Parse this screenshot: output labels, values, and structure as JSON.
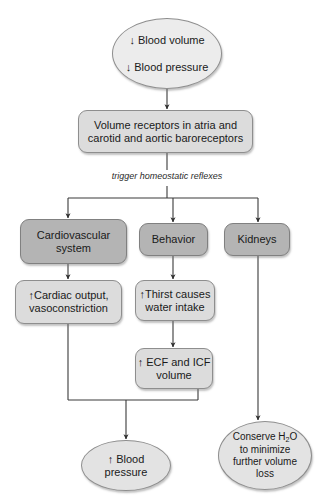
{
  "diagram": {
    "colors": {
      "oval_fill": "#e3e3e3",
      "top_oval_fill": "#ececec",
      "box_fill": "#dcdcdc",
      "dark_box_fill": "#b4b4b4",
      "stroke": "#8e8e8e",
      "line": "#3a3a3a",
      "text": "#1a1a1a"
    },
    "nodes": {
      "stimulus": {
        "shape": "oval",
        "line1": "↓ Blood volume",
        "line2": "↓ Blood pressure"
      },
      "receptors": {
        "shape": "rounded-rect",
        "text": "Volume receptors in atria and\ncarotid and aortic baroreceptors"
      },
      "reflex_label": {
        "shape": "text",
        "text": "trigger homeostatic reflexes"
      },
      "cardiovascular": {
        "shape": "rounded-rect",
        "text": "Cardiovascular\nsystem"
      },
      "behavior": {
        "shape": "rounded-rect",
        "text": "Behavior"
      },
      "kidneys": {
        "shape": "rounded-rect",
        "text": "Kidneys"
      },
      "cardiac_output": {
        "shape": "rounded-rect",
        "text": "↑Cardiac output,\nvasoconstriction"
      },
      "thirst": {
        "shape": "rounded-rect",
        "text": "↑Thirst causes\nwater intake"
      },
      "ecf_icf": {
        "shape": "rounded-rect",
        "text": "↑ ECF and ICF\nvolume"
      },
      "blood_pressure_result": {
        "shape": "oval",
        "text": "↑ Blood\npressure"
      },
      "conserve_water": {
        "shape": "oval",
        "line1_prefix": "Conserve H",
        "line1_sub": "2",
        "line1_suffix": "O",
        "line2": "to minimize",
        "line3": "further volume",
        "line4": "loss"
      }
    }
  }
}
